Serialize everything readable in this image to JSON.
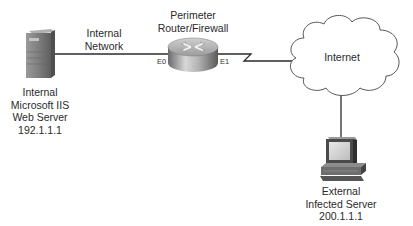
{
  "diagram": {
    "nodes": [
      {
        "id": "internal-server",
        "type": "server-tower",
        "label_lines": [
          "Internal",
          "Microsoft IIS",
          "Web Server",
          "192.1.1.1"
        ]
      },
      {
        "id": "perimeter-router",
        "type": "router",
        "label_lines": [
          "Perimeter",
          "Router/Firewall"
        ],
        "ports": {
          "left": "E0",
          "right": "E1"
        }
      },
      {
        "id": "internet",
        "type": "cloud",
        "label": "Internet"
      },
      {
        "id": "external-server",
        "type": "workstation",
        "label_lines": [
          "External",
          "Infected Server",
          "200.1.1.1"
        ]
      }
    ],
    "links": [
      {
        "from": "internal-server",
        "to": "perimeter-router",
        "type": "ethernet",
        "label_lines": [
          "Internal",
          "Network"
        ]
      },
      {
        "from": "perimeter-router",
        "to": "internet",
        "type": "serial"
      },
      {
        "from": "internet",
        "to": "external-server",
        "type": "ethernet"
      }
    ],
    "colors": {
      "line": "#2b2b2b",
      "cloud_stroke": "#555555",
      "device_gray": "#8a8a8a"
    }
  }
}
